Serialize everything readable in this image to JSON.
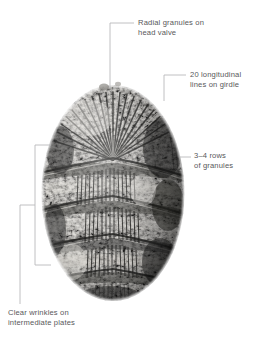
{
  "figure": {
    "background_color": "#ffffff",
    "label_color": "#58585a",
    "leader_line_color": "#b9b9bb",
    "specimen": {
      "description": "Grayscale photograph of an oval fossil chiton shell",
      "center_x": 113,
      "center_y": 193,
      "width": 143,
      "height": 216,
      "radial_line_count": 20,
      "plate_count": 6,
      "tone_dark": "#1d1d1d",
      "tone_mid": "#7b7b79",
      "tone_light": "#e4e2dd"
    }
  },
  "callouts": [
    {
      "id": "radial-granules",
      "text": "Radial granules on\nhead valve",
      "leader": {
        "type": "elbow",
        "label_x": 134,
        "corner_x": 110,
        "corner_y": 23,
        "end_y": 88
      }
    },
    {
      "id": "longitudinal-lines",
      "text": "20 longitudinal\nlines on girdle",
      "leader": {
        "type": "elbow",
        "label_x": 186,
        "corner_x": 164,
        "corner_y": 75,
        "end_y": 101
      }
    },
    {
      "id": "rows-of-granules",
      "text": "3–4 rows\nof granules",
      "leader": {
        "type": "dash",
        "x1": 180,
        "x2": 191,
        "y": 157
      }
    },
    {
      "id": "clear-wrinkles",
      "text": "Clear wrinkles on\nintermediate plates",
      "leader": {
        "type": "bracket",
        "bracket_x": 35,
        "bracket_top_y": 145,
        "bracket_bottom_y": 265,
        "stub_x": 51,
        "mid_y": 205,
        "stem_x": 20,
        "stem_bottom_y": 304
      }
    }
  ]
}
